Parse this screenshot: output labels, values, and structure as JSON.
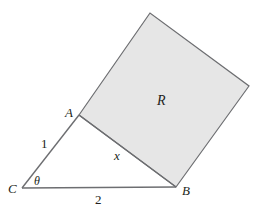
{
  "diagram": {
    "points": {
      "A": "A",
      "B": "B",
      "C": "C"
    },
    "region_label": "R",
    "side_labels": {
      "CA": "1",
      "CB": "2",
      "AB": "x"
    },
    "angle_label": "θ",
    "colors": {
      "square_fill": "#e6e6e6",
      "stroke": "#6d6e71",
      "text": "#231f20"
    }
  }
}
